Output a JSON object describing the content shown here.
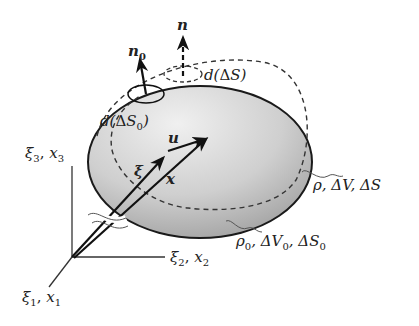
{
  "figure": {
    "colors": {
      "body_fill_light": "#e8e8e8",
      "body_fill_dark": "#a9a9a9",
      "stroke": "#1a1a1a",
      "background": "#ffffff"
    }
  },
  "axes": {
    "x3": {
      "main": "ξ",
      "sub": "3",
      "sep": ", ",
      "main2": "x",
      "sub2": "3"
    },
    "x2": {
      "main": "ξ",
      "sub": "2",
      "sep": ", ",
      "main2": "x",
      "sub2": "2"
    },
    "x1": {
      "main": "ξ",
      "sub": "1",
      "sep": ", ",
      "main2": "x",
      "sub2": "1"
    }
  },
  "vectors": {
    "xi": "ξ",
    "x": "x",
    "u": "u"
  },
  "normals": {
    "n0": {
      "main": "n",
      "sub": "0"
    },
    "n": {
      "main": "n"
    }
  },
  "surface_elements": {
    "dS0": {
      "pre": "d(",
      "delta": "Δ",
      "var": "S",
      "sub": "0",
      "post": ")"
    },
    "dS": {
      "pre": "d(",
      "delta": "Δ",
      "var": "S",
      "post": ")"
    }
  },
  "configurations": {
    "current": {
      "text1": "ρ",
      "text2": ", ΔV, ΔS"
    },
    "reference": {
      "rho": "ρ",
      "sub_rho": "0",
      "dv": ", ΔV",
      "sub_v": "0",
      "ds": ", ΔS",
      "sub_s": "0"
    }
  }
}
